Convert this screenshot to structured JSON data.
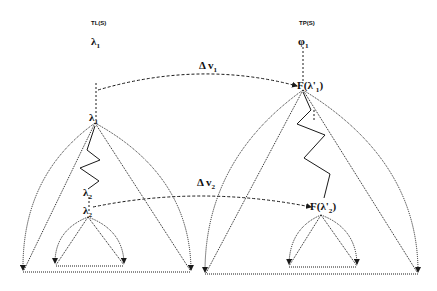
{
  "diagram": {
    "type": "tree-mapping",
    "colors": {
      "ink": "#1a1a1a",
      "background": "#ffffff"
    },
    "left_tree": {
      "title": "TL(S)",
      "root_label": "λ",
      "root_sub": "1",
      "node1_label": "λ",
      "node1_sub": "1",
      "node2_label": "λ",
      "node2_sub": "2",
      "node2b_label": "λ",
      "node2b_sub": "2"
    },
    "right_tree": {
      "title": "TP(S)",
      "root_label": "φ",
      "root_sub": "1",
      "node1_label": "F(λ",
      "node1_prime": "'",
      "node1_sub": "1",
      "node1_close": ")",
      "node2_label": "F(λ",
      "node2_prime": "'",
      "node2_sub": "2",
      "node2_close": ")"
    },
    "mappings": [
      {
        "label": "Δ v",
        "sub": "1"
      },
      {
        "label": "Δ v",
        "sub": "2"
      }
    ]
  }
}
